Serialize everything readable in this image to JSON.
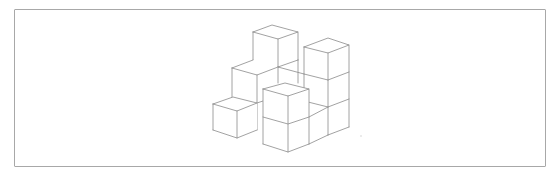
{
  "figure": {
    "stroke_color": "#8a8a8a",
    "frame_color": "#a8a8a8",
    "background": "#ffffff",
    "cube_count_visible": 9
  }
}
